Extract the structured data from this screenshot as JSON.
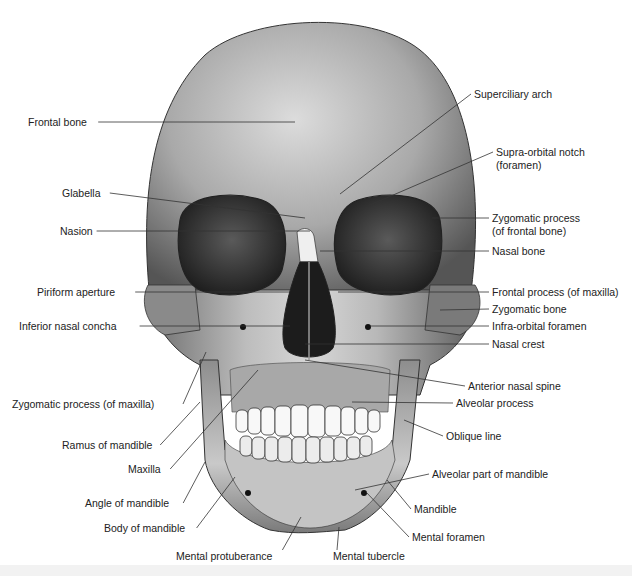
{
  "figure": {
    "line_color": "#333333",
    "bone_light": "#e8e8e8",
    "bone_dark": "#6a6a6a",
    "cavity_color": "#1e1e1e"
  },
  "labels_left": [
    {
      "id": "frontal-bone",
      "text": "Frontal bone",
      "x": 28,
      "y": 116,
      "to": [
        295,
        122
      ]
    },
    {
      "id": "glabella",
      "text": "Glabella",
      "x": 62,
      "y": 187,
      "to": [
        305,
        218
      ]
    },
    {
      "id": "nasion",
      "text": "Nasion",
      "x": 60,
      "y": 225,
      "to": [
        310,
        231
      ]
    },
    {
      "id": "piriform-aperture",
      "text": "Piriform aperture",
      "x": 37,
      "y": 286,
      "to": [
        290,
        292
      ]
    },
    {
      "id": "inferior-nasal-concha",
      "text": "Inferior nasal concha",
      "x": 19,
      "y": 320,
      "to": [
        290,
        326
      ]
    },
    {
      "id": "zygomatic-process-maxilla",
      "text": "Zygomatic process (of maxilla)",
      "x": 12,
      "y": 398,
      "to": [
        206,
        352
      ]
    },
    {
      "id": "ramus-of-mandible",
      "text": "Ramus of mandible",
      "x": 62,
      "y": 439,
      "to": [
        200,
        402
      ]
    },
    {
      "id": "maxilla",
      "text": "Maxilla",
      "x": 128,
      "y": 463,
      "to": [
        258,
        370
      ]
    },
    {
      "id": "angle-of-mandible",
      "text": "Angle of mandible",
      "x": 85,
      "y": 497,
      "to": [
        205,
        462
      ]
    },
    {
      "id": "body-of-mandible",
      "text": "Body of mandible",
      "x": 104,
      "y": 522,
      "to": [
        235,
        477
      ]
    }
  ],
  "labels_right": [
    {
      "id": "superciliary-arch",
      "text": "Superciliary arch",
      "x": 474,
      "y": 88,
      "to": [
        340,
        194
      ]
    },
    {
      "id": "supra-orbital-notch",
      "text": "Supra-orbital notch",
      "text2": "(foramen)",
      "x": 496,
      "y": 146,
      "to": [
        370,
        205
      ]
    },
    {
      "id": "zygomatic-process-frontal",
      "text": "Zygomatic process",
      "text2": "(of frontal bone)",
      "x": 492,
      "y": 212,
      "to": [
        432,
        218
      ]
    },
    {
      "id": "nasal-bone",
      "text": "Nasal bone",
      "x": 492,
      "y": 245,
      "to": [
        320,
        251
      ]
    },
    {
      "id": "frontal-process-maxilla",
      "text": "Frontal process (of maxilla)",
      "x": 492,
      "y": 286,
      "to": [
        338,
        292
      ]
    },
    {
      "id": "zygomatic-bone",
      "text": "Zygomatic bone",
      "x": 492,
      "y": 303,
      "to": [
        440,
        310
      ]
    },
    {
      "id": "infra-orbital-foramen",
      "text": "Infra-orbital foramen",
      "x": 492,
      "y": 320,
      "to": [
        370,
        326
      ]
    },
    {
      "id": "nasal-crest",
      "text": "Nasal crest",
      "x": 492,
      "y": 338,
      "to": [
        305,
        344
      ]
    },
    {
      "id": "anterior-nasal-spine",
      "text": "Anterior nasal spine",
      "x": 468,
      "y": 380,
      "to": [
        305,
        360
      ]
    },
    {
      "id": "alveolar-process",
      "text": "Alveolar process",
      "x": 456,
      "y": 397,
      "to": [
        352,
        402
      ]
    },
    {
      "id": "oblique-line",
      "text": "Oblique line",
      "x": 446,
      "y": 430,
      "to": [
        404,
        420
      ]
    },
    {
      "id": "alveolar-part-of-mandible",
      "text": "Alveolar part of mandible",
      "x": 432,
      "y": 468,
      "to": [
        355,
        490
      ]
    },
    {
      "id": "mandible",
      "text": "Mandible",
      "x": 414,
      "y": 503,
      "to": [
        387,
        480
      ]
    },
    {
      "id": "mental-foramen",
      "text": "Mental foramen",
      "x": 412,
      "y": 531,
      "to": [
        366,
        492
      ]
    }
  ],
  "labels_bottom": [
    {
      "id": "mental-protuberance",
      "text": "Mental protuberance",
      "x": 176,
      "y": 550,
      "to": [
        301,
        517
      ]
    },
    {
      "id": "mental-tubercle",
      "text": "Mental tubercle",
      "x": 333,
      "y": 550,
      "to": [
        339,
        527
      ]
    }
  ]
}
